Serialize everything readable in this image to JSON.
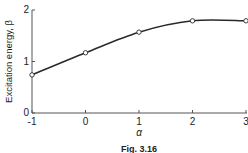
{
  "chart_data": {
    "type": "line",
    "title": "",
    "caption": "Fig. 3.16",
    "xlabel": "α",
    "ylabel": "Excitation energy, β",
    "x": [
      -1,
      0,
      1,
      2,
      3
    ],
    "series": [
      {
        "name": "Excitation energy",
        "values": [
          0.74,
          1.17,
          1.57,
          1.79,
          1.79
        ],
        "marker": "open-circle",
        "smooth": true
      }
    ],
    "xlim": [
      -1,
      3
    ],
    "ylim": [
      0,
      2
    ],
    "xticks": [
      "-1",
      "0",
      "1",
      "2",
      "3"
    ],
    "yticks": [
      "0",
      "1",
      "2"
    ],
    "grid": false,
    "legend": null
  },
  "colors": {
    "line": "#2a2a2a",
    "axis": "#555555",
    "text": "#222222"
  }
}
